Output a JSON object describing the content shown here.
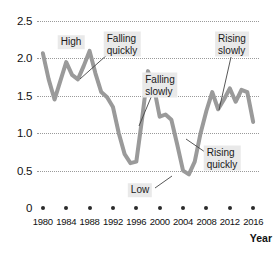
{
  "title": "",
  "axis": {
    "x_title": "Year",
    "y_ticks": [
      "2.5",
      "2.0",
      "1.5",
      "1.0",
      "0.5",
      "0"
    ],
    "x_ticks": [
      "1980",
      "1984",
      "1988",
      "1992",
      "1996",
      "2000",
      "2004",
      "2008",
      "2012",
      "2016"
    ]
  },
  "annotations": [
    {
      "id": "high",
      "label": "High"
    },
    {
      "id": "falling-quickly",
      "label": "Falling\nquickly"
    },
    {
      "id": "falling-slowly",
      "label": "Falling\nslowly"
    },
    {
      "id": "rising-slowly",
      "label": "Rising\nslowly"
    },
    {
      "id": "rising-quickly",
      "label": "Rising\nquickly"
    },
    {
      "id": "low",
      "label": "Low"
    }
  ],
  "colors": {
    "line": "#9a9a9a",
    "grid": "#9a9a9a",
    "anno_bg": "#e9e9e9",
    "text": "#1a1a1a"
  },
  "chart_data": {
    "type": "line",
    "title": "",
    "xlabel": "Year",
    "ylabel": "",
    "xlim": [
      1979,
      2017
    ],
    "ylim": [
      0,
      2.5
    ],
    "grid": true,
    "legend": "none",
    "x": [
      1980,
      1981,
      1982,
      1983,
      1984,
      1985,
      1986,
      1987,
      1988,
      1989,
      1990,
      1991,
      1992,
      1993,
      1994,
      1995,
      1996,
      1997,
      1998,
      1999,
      2000,
      2001,
      2002,
      2003,
      2004,
      2005,
      2006,
      2007,
      2008,
      2009,
      2010,
      2011,
      2012,
      2013,
      2014,
      2015,
      2016
    ],
    "series": [
      {
        "name": "value",
        "values": [
          2.07,
          1.72,
          1.45,
          1.7,
          1.95,
          1.78,
          1.72,
          1.9,
          2.1,
          1.8,
          1.55,
          1.48,
          1.35,
          1.0,
          0.72,
          0.6,
          0.62,
          1.2,
          1.83,
          1.62,
          1.22,
          1.25,
          1.18,
          0.85,
          0.5,
          0.45,
          0.62,
          1.0,
          1.3,
          1.55,
          1.32,
          1.45,
          1.6,
          1.42,
          1.58,
          1.55,
          1.15
        ]
      }
    ],
    "annotations": [
      {
        "text": "High",
        "x": 1988,
        "y": 2.1,
        "kind": "peak"
      },
      {
        "text": "Falling quickly",
        "x": 1990,
        "y": 1.72,
        "kind": "segment"
      },
      {
        "text": "Falling slowly",
        "x": 2000,
        "y": 1.22,
        "kind": "segment"
      },
      {
        "text": "Rising slowly",
        "x": 2012,
        "y": 1.6,
        "kind": "segment"
      },
      {
        "text": "Rising quickly",
        "x": 2007,
        "y": 1.0,
        "kind": "segment"
      },
      {
        "text": "Low",
        "x": 2005,
        "y": 0.45,
        "kind": "trough"
      }
    ]
  }
}
